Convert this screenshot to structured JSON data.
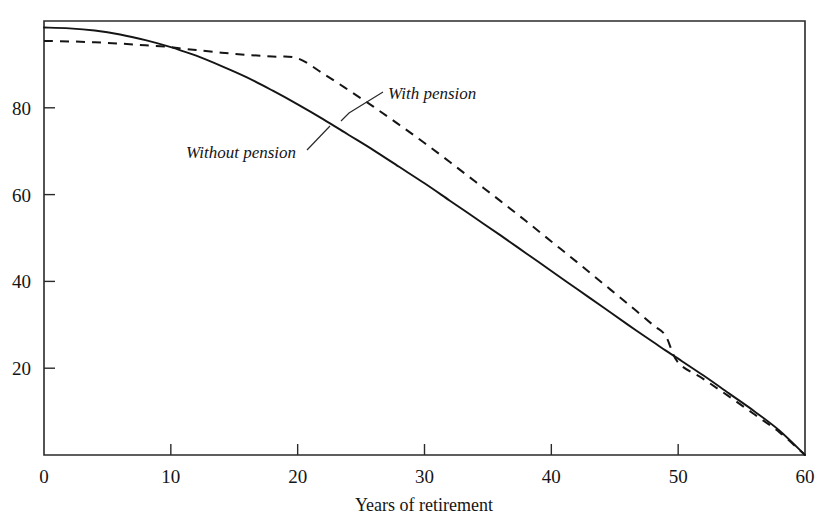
{
  "figure": {
    "clipped_caption_above_frame": "age of earnings replaced by pension and savings during retirement",
    "background_color": "#ffffff",
    "ink_color": "#151515"
  },
  "chart_data": {
    "type": "line",
    "title": "",
    "xlabel": "Years of retirement",
    "ylabel": "",
    "xlim": [
      0,
      60
    ],
    "ylim": [
      0,
      100
    ],
    "xticks": [
      0,
      10,
      20,
      30,
      40,
      50,
      60
    ],
    "xtick_labels": [
      "0",
      "10",
      "20",
      "30",
      "40",
      "50",
      "60"
    ],
    "yticks": [
      20,
      40,
      60,
      80
    ],
    "ytick_labels": [
      "20",
      "40",
      "60",
      "80"
    ],
    "grid": false,
    "legend_position": "inline-annotations",
    "frame": "box",
    "x": [
      0,
      2,
      4,
      6,
      8,
      10,
      11,
      12,
      14,
      16,
      18,
      20,
      22,
      24,
      26,
      28,
      30,
      32,
      34,
      36,
      38,
      40,
      42,
      44,
      46,
      48,
      49,
      50,
      52,
      54,
      56,
      58,
      60
    ],
    "series": [
      {
        "name": "Without pension",
        "style": "solid",
        "color": "#151515",
        "values": [
          98.5,
          98.3,
          97.8,
          96.9,
          95.6,
          94.0,
          93.0,
          92.0,
          89.6,
          87.0,
          84.0,
          80.8,
          77.4,
          73.8,
          70.2,
          66.4,
          62.6,
          58.6,
          54.6,
          50.6,
          46.5,
          42.4,
          38.3,
          34.2,
          30.1,
          26.1,
          24.1,
          22.2,
          18.3,
          14.2,
          10.1,
          5.6,
          0.0
        ]
      },
      {
        "name": "With pension",
        "style": "dashed",
        "color": "#151515",
        "values": [
          95.4,
          95.3,
          95.1,
          94.8,
          94.4,
          94.0,
          93.6,
          93.3,
          92.7,
          92.2,
          91.8,
          91.4,
          87.9,
          84.1,
          80.2,
          76.1,
          71.9,
          67.5,
          63.0,
          58.5,
          53.9,
          49.2,
          44.5,
          39.7,
          34.9,
          30.0,
          27.5,
          21.3,
          17.5,
          13.5,
          9.4,
          5.2,
          0.0
        ]
      }
    ],
    "annotations": [
      {
        "text": "With pension",
        "target_series": "With pension",
        "label_x_px": 388,
        "label_y_px": 97,
        "leader_from_px": [
          383,
          92
        ],
        "leader_to_px": [
          348,
          114
        ],
        "leader_elbow_px": [
          341,
          121
        ]
      },
      {
        "text": "Without pension",
        "target_series": "Without pension",
        "label_x_px": 186,
        "label_y_px": 156,
        "leader_from_px": [
          307,
          148
        ],
        "leader_to_px": [
          329,
          126
        ]
      }
    ]
  }
}
